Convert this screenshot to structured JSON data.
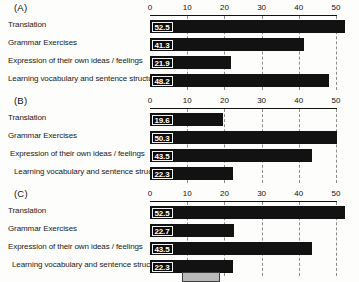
{
  "figure": {
    "categories": [
      "Translation",
      "Grammar Exercises",
      "Expression of their own ideas / feelings",
      "Learning vocabulary and sentence structures"
    ],
    "tick_labels": [
      "0",
      "10",
      "20",
      "30",
      "40",
      "50"
    ],
    "panels": [
      {
        "tag": "(A)",
        "values": [
          "52.5",
          "41.3",
          "21.9",
          "48.2"
        ]
      },
      {
        "tag": "(B)",
        "values": [
          "19.6",
          "50.3",
          "43.5",
          "22.3"
        ]
      },
      {
        "tag": "(C)",
        "values": [
          "52.5",
          "22.7",
          "43.5",
          "22.3"
        ]
      }
    ]
  },
  "chart_data": [
    {
      "type": "bar",
      "title": "(A)",
      "orientation": "horizontal",
      "categories": [
        "Translation",
        "Grammar Exercises",
        "Expression of their own ideas / feelings",
        "Learning vocabulary and sentence structures"
      ],
      "values": [
        52.5,
        41.3,
        21.9,
        48.2
      ],
      "xlabel": "",
      "ylabel": "",
      "xlim": [
        0,
        50
      ],
      "xticks": [
        0,
        10,
        20,
        30,
        40,
        50
      ],
      "grid": true,
      "legend": false,
      "bar_color": "#121212",
      "data_labels": true
    },
    {
      "type": "bar",
      "title": "(B)",
      "orientation": "horizontal",
      "categories": [
        "Translation",
        "Grammar Exercises",
        "Expression of their own ideas / feelings",
        "Learning vocabulary and sentence structures"
      ],
      "values": [
        19.6,
        50.3,
        43.5,
        22.3
      ],
      "xlabel": "",
      "ylabel": "",
      "xlim": [
        0,
        50
      ],
      "xticks": [
        0,
        10,
        20,
        30,
        40,
        50
      ],
      "grid": true,
      "legend": false,
      "bar_color": "#121212",
      "data_labels": true
    },
    {
      "type": "bar",
      "title": "(C)",
      "orientation": "horizontal",
      "categories": [
        "Translation",
        "Grammar Exercises",
        "Expression of their own ideas / feelings",
        "Learning vocabulary and sentence structures"
      ],
      "values": [
        52.5,
        22.7,
        43.5,
        22.3
      ],
      "xlabel": "",
      "ylabel": "",
      "xlim": [
        0,
        50
      ],
      "xticks": [
        0,
        10,
        20,
        30,
        40,
        50
      ],
      "grid": true,
      "legend": false,
      "bar_color": "#121212",
      "data_labels": true
    }
  ]
}
